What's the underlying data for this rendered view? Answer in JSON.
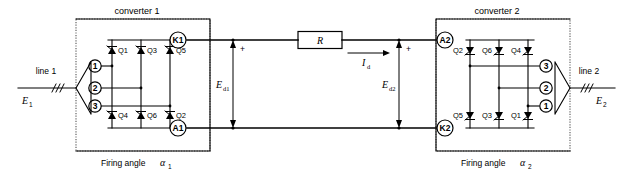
{
  "diagram": {
    "type": "schematic",
    "converters": [
      {
        "id": "converter1",
        "caption": "converter 1",
        "firing_angle": "Firing angle",
        "firing_angle_symbol": "α",
        "firing_angle_sub": "1",
        "dc_terminal_top": "K1",
        "dc_terminal_bottom": "A1",
        "ac_terminals": [
          "1",
          "2",
          "3"
        ],
        "thyristors_top": [
          "Q1",
          "Q3",
          "Q5"
        ],
        "thyristors_bottom": [
          "Q4",
          "Q6",
          "Q2"
        ],
        "label_side": "right"
      },
      {
        "id": "converter2",
        "caption": "converter 2",
        "firing_angle": "Firing angle",
        "firing_angle_symbol": "α",
        "firing_angle_sub": "2",
        "dc_terminal_top": "A2",
        "dc_terminal_bottom": "K2",
        "ac_terminals": [
          "3",
          "2",
          "1"
        ],
        "thyristors_top": [
          "Q2",
          "Q6",
          "Q4"
        ],
        "thyristors_bottom": [
          "Q5",
          "Q3",
          "Q1"
        ],
        "label_side": "left"
      }
    ],
    "lines": [
      {
        "id": "line1",
        "name": "line 1",
        "voltage_symbol": "E",
        "voltage_sub": "1",
        "side": "left",
        "phase_marks": 3
      },
      {
        "id": "line2",
        "name": "line 2",
        "voltage_symbol": "E",
        "voltage_sub": "2",
        "side": "right",
        "phase_marks": 3
      }
    ],
    "dc_link": {
      "resistor_label": "R",
      "current_symbol": "I",
      "current_sub": "d",
      "voltage_left_symbol": "E",
      "voltage_left_sub": "d1",
      "voltage_right_symbol": "E",
      "voltage_right_sub": "d2",
      "polarity_left": "+",
      "polarity_right": "+"
    },
    "colors": {
      "ink": "#000000",
      "dotted_border": "#555555",
      "background": "#ffffff"
    }
  }
}
